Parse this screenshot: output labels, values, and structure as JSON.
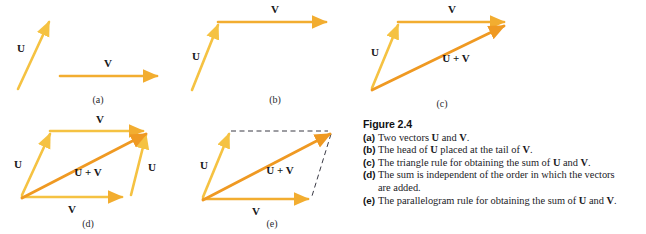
{
  "colors": {
    "vector_u": "#f5c242",
    "vector_v": "#f2ad30",
    "vector_sum": "#ef9922",
    "dashed": "#3a3a45",
    "text": "#1b1b1f",
    "background": "#ffffff"
  },
  "labels": {
    "u": "U",
    "v": "V",
    "sum": "U + V"
  },
  "panels": [
    {
      "id": "a",
      "sublabel": "(a)"
    },
    {
      "id": "b",
      "sublabel": "(b)"
    },
    {
      "id": "c",
      "sublabel": "(c)"
    },
    {
      "id": "d",
      "sublabel": "(d)"
    },
    {
      "id": "e",
      "sublabel": "(e)"
    }
  ],
  "caption": {
    "title": "Figure 2.4",
    "items": [
      {
        "key": "(a)",
        "text_parts": [
          "Two vectors ",
          "U",
          " and ",
          "V",
          "."
        ],
        "plain": "Two vectors U and V."
      },
      {
        "key": "(b)",
        "plain": "The head of U placed at the tail of V."
      },
      {
        "key": "(c)",
        "plain": "The triangle rule for obtaining the sum of U and V."
      },
      {
        "key": "(d)",
        "plain": "The sum is independent of the order in which the vectors",
        "continuation": "are added."
      },
      {
        "key": "(e)",
        "plain": "The parallelogram rule for obtaining the sum of U and V."
      }
    ]
  }
}
